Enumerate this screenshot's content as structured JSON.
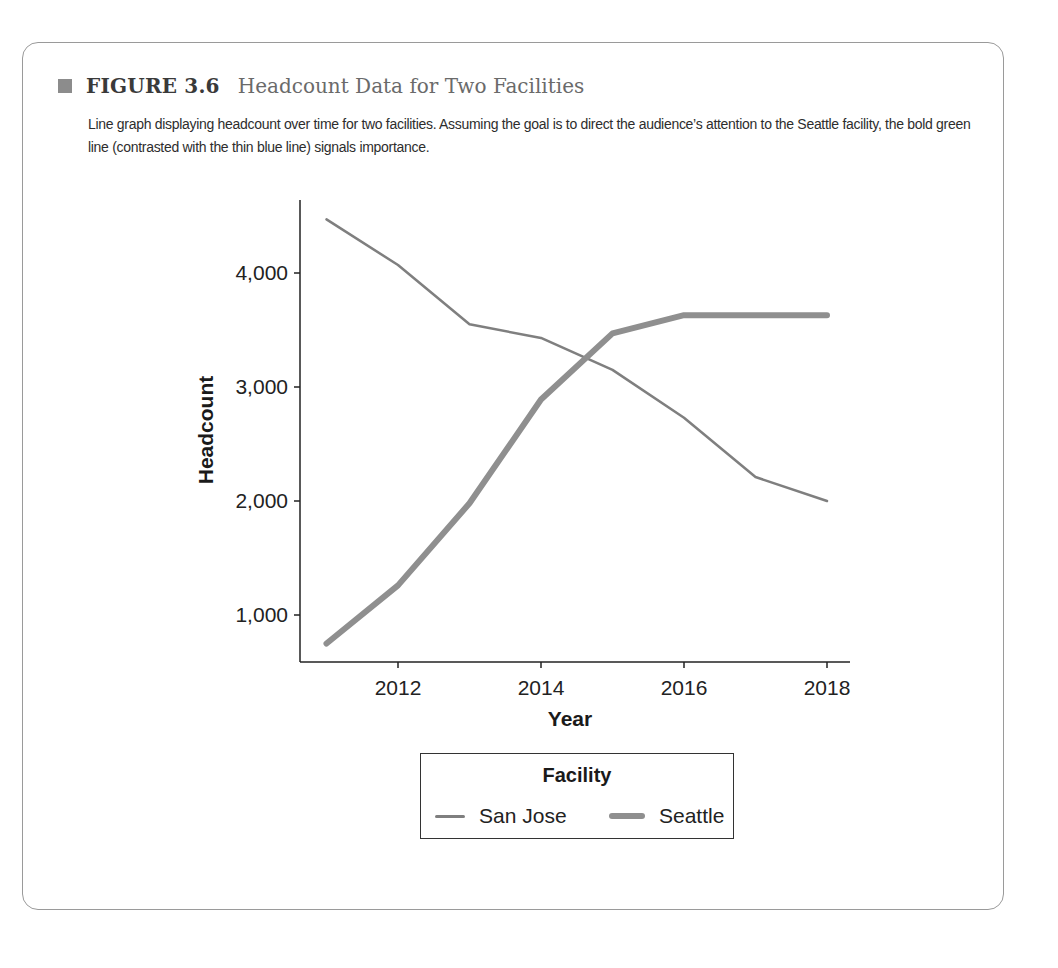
{
  "figure": {
    "label": "FIGURE 3.6",
    "title": "Headcount Data for Two Facilities",
    "caption": "Line graph displaying headcount over time for two facilities. Assuming the goal is to direct the audience’s attention to the Seattle facility, the bold green line (contrasted with the thin blue line) signals importance."
  },
  "colors": {
    "san_jose": "#7f7f7f",
    "seattle": "#8f8f8f",
    "axis": "#222222",
    "square": "#8c8c8c"
  },
  "chart_data": {
    "type": "line",
    "title": "Headcount Data for Two Facilities",
    "xlabel": "Year",
    "ylabel": "Headcount",
    "x": [
      2011,
      2012,
      2013,
      2014,
      2015,
      2016,
      2017,
      2018
    ],
    "x_ticks": [
      "2012",
      "2014",
      "2016",
      "2018"
    ],
    "y_ticks": [
      "1,000",
      "2,000",
      "3,000",
      "4,000"
    ],
    "ylim": [
      560,
      4690
    ],
    "xlim": [
      2010.6,
      2018.3
    ],
    "grid": false,
    "legend_title": "Facility",
    "legend_position": "bottom",
    "series": [
      {
        "name": "San Jose",
        "style": "thin",
        "values": [
          4470,
          4070,
          3550,
          3430,
          3150,
          2730,
          2210,
          2000
        ]
      },
      {
        "name": "Seattle",
        "style": "bold",
        "values": [
          750,
          1260,
          1980,
          2890,
          3470,
          3630,
          3630,
          3630
        ]
      }
    ]
  }
}
